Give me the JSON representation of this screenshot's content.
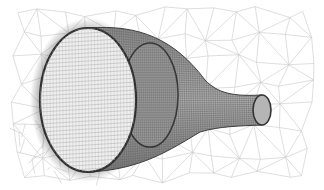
{
  "image": {
    "subject": "wireframe mesh of a tapered tube (nozzle) with surrounding triangulated volume mesh",
    "palette": {
      "background": "#ffffff",
      "background_mesh": "#c8c8c8",
      "tube_surface": "#8a8a8a",
      "tube_dark_edge": "#3a3a3a",
      "front_face": "#efefef",
      "inner_opening": "#9a9a9a"
    },
    "parts": [
      {
        "name": "background-mesh",
        "kind": "triangulated volume mesh"
      },
      {
        "name": "large-front-opening",
        "kind": "ellipse, light interior with fine grid"
      },
      {
        "name": "middle-opening",
        "kind": "ellipse, dark inner section"
      },
      {
        "name": "tapered-neck",
        "kind": "dense wireframe surface"
      },
      {
        "name": "small-outlet-opening",
        "kind": "small ellipse at narrow end"
      }
    ]
  }
}
